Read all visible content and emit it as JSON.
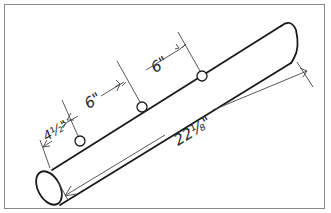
{
  "figure": {
    "stroke_color": "#1a1a1a",
    "dimension_line_color": "#444444",
    "frame_color": "#8a8a8a"
  },
  "dimensions": {
    "end_to_first_hole": "4½\"",
    "hole1_to_hole2": "6\"",
    "hole2_to_hole3": "6\"",
    "overall_length": "22⅛\""
  },
  "holes": [
    {
      "label": "hole-1"
    },
    {
      "label": "hole-2"
    },
    {
      "label": "hole-3"
    }
  ]
}
